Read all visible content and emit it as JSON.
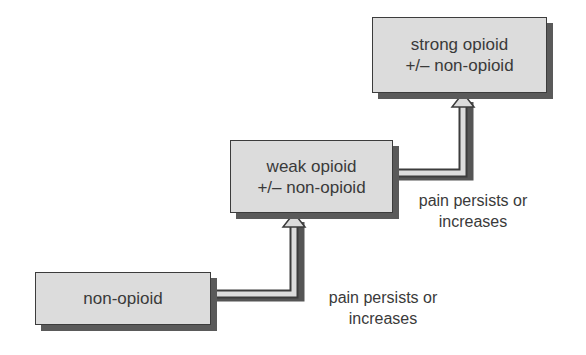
{
  "diagram": {
    "type": "staircase-flow",
    "steps": [
      {
        "id": "step1",
        "lines": [
          "non-opioid"
        ]
      },
      {
        "id": "step2",
        "lines": [
          "weak opioid",
          "+/– non-opioid"
        ]
      },
      {
        "id": "step3",
        "lines": [
          "strong opioid",
          "+/– non-opioid"
        ]
      }
    ],
    "transitions": [
      {
        "from": "step1",
        "to": "step2",
        "lines": [
          "pain persists or",
          "increases"
        ]
      },
      {
        "from": "step2",
        "to": "step3",
        "lines": [
          "pain persists or",
          "increases"
        ]
      }
    ],
    "colors": {
      "box_fill": "#dcdcdc",
      "box_border": "#3c3c3c",
      "shadow": "#5a5a5a",
      "text": "#3a3a3a",
      "background": "#ffffff"
    }
  }
}
